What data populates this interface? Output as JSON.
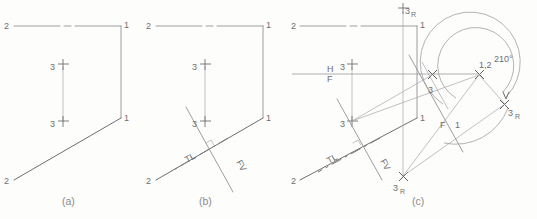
{
  "figure": {
    "background_color": "#fdfdfc",
    "line_color": "#8d8d90",
    "label_color": "#6e6e70",
    "caption_color": "#8a8a8c"
  },
  "captions": {
    "a": "(a)",
    "b": "(b)",
    "c": "(c)"
  },
  "panel_a": {
    "labels": {
      "top_left_2": "2",
      "top_right_1": "1",
      "mid_right_1": "1",
      "bottom_left_2": "2",
      "upper_3_prime": "3",
      "lower_3_prime": "3",
      "prime_mark": "'"
    }
  },
  "panel_b": {
    "labels": {
      "top_left_2": "2",
      "top_right_1": "1",
      "mid_right_1": "1",
      "bottom_left_2": "2",
      "upper_3_prime": "3",
      "lower_3_prime": "3",
      "true_length": "TL",
      "frontal_view": "FV"
    }
  },
  "panel_c": {
    "labels": {
      "top_left_2": "2",
      "top_right_1": "1",
      "mid_right_1": "1",
      "bottom_left_2": "2",
      "upper_3_prime": "3",
      "lower_3_prime": "3",
      "center_1_2": "1,2",
      "true_length": "TL",
      "frontal_view": "FV",
      "ref_h": "H",
      "ref_f": "F",
      "aux_f": "F",
      "aux_1": "1",
      "angle": "210°",
      "rotated_top": "3",
      "rotated_top_sub": "R",
      "rotated_bottom": "3",
      "rotated_bottom_sub": "R",
      "rotated_right": "3",
      "rotated_right_sub": "R",
      "pivot_3": "3",
      "subscript_R": "R"
    }
  }
}
